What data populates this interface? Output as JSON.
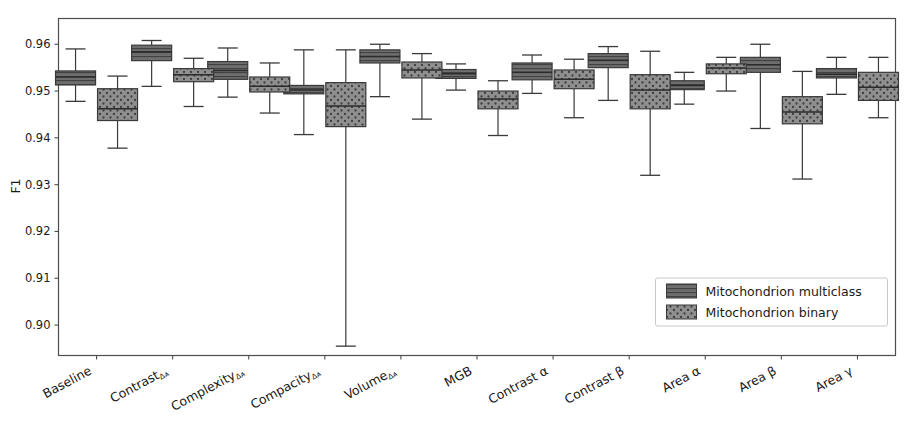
{
  "chart_data": {
    "type": "box",
    "title": "",
    "xlabel": "",
    "ylabel": "F1",
    "ylim": [
      0.8935,
      0.9655
    ],
    "yticks": [
      0.9,
      0.91,
      0.92,
      0.93,
      0.94,
      0.95,
      0.96
    ],
    "ytick_labels": [
      "0.90",
      "0.91",
      "0.92",
      "0.93",
      "0.94",
      "0.95",
      "0.96"
    ],
    "grid": false,
    "legend_position": "lower right",
    "categories": [
      "Baseline",
      "ContrastΔᴀ",
      "ComplexityΔᴀ",
      "CompacityΔᴀ",
      "VolumeΔᴀ",
      "MGB",
      "Contrast α",
      "Contrast β",
      "Area α",
      "Area β",
      "Area γ"
    ],
    "category_parts": [
      {
        "base": "Baseline",
        "sub": ""
      },
      {
        "base": "Contrast",
        "sub": "Δᴀ"
      },
      {
        "base": "Complexity",
        "sub": "Δᴀ"
      },
      {
        "base": "Compacity",
        "sub": "Δᴀ"
      },
      {
        "base": "Volume",
        "sub": "Δᴀ"
      },
      {
        "base": "MGB",
        "sub": ""
      },
      {
        "base": "Contrast α",
        "sub": ""
      },
      {
        "base": "Contrast β",
        "sub": ""
      },
      {
        "base": "Area α",
        "sub": ""
      },
      {
        "base": "Area β",
        "sub": ""
      },
      {
        "base": "Area γ",
        "sub": ""
      }
    ],
    "series": [
      {
        "name": "Mitochondrion multiclass",
        "fill": "#6e6e6e",
        "hatch": "horizontal-lines",
        "boxes": [
          {
            "whisker_low": 0.9478,
            "q1": 0.9513,
            "median": 0.953,
            "q3": 0.9543,
            "whisker_high": 0.959
          },
          {
            "whisker_low": 0.951,
            "q1": 0.9565,
            "median": 0.9584,
            "q3": 0.9598,
            "whisker_high": 0.9608
          },
          {
            "whisker_low": 0.9487,
            "q1": 0.9525,
            "median": 0.9544,
            "q3": 0.9563,
            "whisker_high": 0.9592
          },
          {
            "whisker_low": 0.9407,
            "q1": 0.9494,
            "median": 0.9502,
            "q3": 0.9512,
            "whisker_high": 0.9588
          },
          {
            "whisker_low": 0.9488,
            "q1": 0.956,
            "median": 0.9574,
            "q3": 0.9588,
            "whisker_high": 0.96
          },
          {
            "whisker_low": 0.9502,
            "q1": 0.9527,
            "median": 0.9537,
            "q3": 0.9546,
            "whisker_high": 0.9558
          },
          {
            "whisker_low": 0.9495,
            "q1": 0.9524,
            "median": 0.954,
            "q3": 0.956,
            "whisker_high": 0.9577
          },
          {
            "whisker_low": 0.948,
            "q1": 0.955,
            "median": 0.9566,
            "q3": 0.958,
            "whisker_high": 0.9595
          },
          {
            "whisker_low": 0.9472,
            "q1": 0.9503,
            "median": 0.9512,
            "q3": 0.9522,
            "whisker_high": 0.954
          },
          {
            "whisker_low": 0.942,
            "q1": 0.954,
            "median": 0.9556,
            "q3": 0.9572,
            "whisker_high": 0.96
          },
          {
            "whisker_low": 0.9493,
            "q1": 0.9528,
            "median": 0.9536,
            "q3": 0.9548,
            "whisker_high": 0.9572
          }
        ]
      },
      {
        "name": "Mitochondrion binary",
        "fill": "#8a8a8a",
        "hatch": "dots",
        "boxes": [
          {
            "whisker_low": 0.9378,
            "q1": 0.9437,
            "median": 0.9462,
            "q3": 0.9505,
            "whisker_high": 0.9532
          },
          {
            "whisker_low": 0.9467,
            "q1": 0.952,
            "median": 0.9535,
            "q3": 0.9548,
            "whisker_high": 0.957
          },
          {
            "whisker_low": 0.9453,
            "q1": 0.9498,
            "median": 0.951,
            "q3": 0.953,
            "whisker_high": 0.956
          },
          {
            "whisker_low": 0.8955,
            "q1": 0.9424,
            "median": 0.9468,
            "q3": 0.9518,
            "whisker_high": 0.9588
          },
          {
            "whisker_low": 0.944,
            "q1": 0.9528,
            "median": 0.9545,
            "q3": 0.9562,
            "whisker_high": 0.958
          },
          {
            "whisker_low": 0.9405,
            "q1": 0.9462,
            "median": 0.9483,
            "q3": 0.95,
            "whisker_high": 0.9522
          },
          {
            "whisker_low": 0.9443,
            "q1": 0.9505,
            "median": 0.9525,
            "q3": 0.9545,
            "whisker_high": 0.9568
          },
          {
            "whisker_low": 0.932,
            "q1": 0.9462,
            "median": 0.9502,
            "q3": 0.9535,
            "whisker_high": 0.9585
          },
          {
            "whisker_low": 0.95,
            "q1": 0.9537,
            "median": 0.9549,
            "q3": 0.9558,
            "whisker_high": 0.9572
          },
          {
            "whisker_low": 0.9312,
            "q1": 0.943,
            "median": 0.9455,
            "q3": 0.9488,
            "whisker_high": 0.9542
          },
          {
            "whisker_low": 0.9443,
            "q1": 0.948,
            "median": 0.9508,
            "q3": 0.954,
            "whisker_high": 0.9572
          }
        ]
      }
    ],
    "legend_entries": [
      {
        "label": "Mitochondrion multiclass",
        "fill": "#6e6e6e",
        "hatch": "horizontal-lines"
      },
      {
        "label": "Mitochondrion binary",
        "fill": "#8a8a8a",
        "hatch": "dots"
      }
    ]
  },
  "colors": {
    "axis": "#4d4d4d",
    "text": "#1a1a1a",
    "background": "#ffffff",
    "multiclass_fill": "#6e6e6e",
    "binary_fill": "#8a8a8a",
    "edge": "#3a3a3a"
  }
}
